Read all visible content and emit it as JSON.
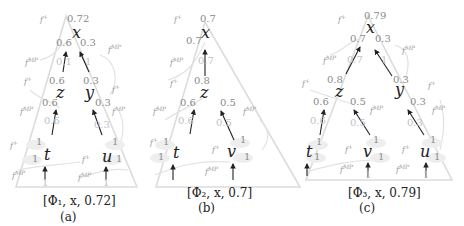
{
  "figures": [
    {
      "id": "a",
      "caption_formula": "[Φ₁, x, 0.72]",
      "sub_label": "(a)",
      "root": {
        "var": "x",
        "value": "0.72",
        "fn": "f⁺"
      },
      "root_inputs": {
        "left": "0.6",
        "right": "0.3",
        "fn": "f^MP"
      },
      "edges_mid": {
        "left": "0.1",
        "right": "1"
      },
      "level2": [
        {
          "var": "z",
          "value": "0.6",
          "fn": "f⁺",
          "input": "0.6",
          "input_fn": "f^MP",
          "edge": "0.6"
        },
        {
          "var": "y",
          "value": "0.3",
          "fn": "f⁺",
          "input": "0.3",
          "input_fn": "f^MP",
          "edge": "0.3"
        }
      ],
      "leaves": [
        {
          "var": "t",
          "value": "1",
          "fn": "f⁺",
          "input": "1",
          "input_fn": "f^MP",
          "edge": "1"
        },
        {
          "var": "u",
          "value": "1",
          "fn": "f⁺",
          "input": "1",
          "input_fn": "f^MP",
          "edge": "1"
        }
      ]
    },
    {
      "id": "b",
      "caption_formula": "[Φ₂, x, 0.7]",
      "sub_label": "(b)",
      "root": {
        "var": "x",
        "value": "0.7",
        "fn": "f⁺"
      },
      "root_inputs": {
        "left": "0.7",
        "fn": "f^MP"
      },
      "edges_mid": {
        "left": "0.7"
      },
      "level2": [
        {
          "var": "z",
          "value": "0.8",
          "fn": "f⁺",
          "inputs": [
            "0.6",
            "0.5"
          ],
          "input_fns": [
            "f^MP",
            "f^MP"
          ],
          "edges": [
            "0.6",
            "0.5"
          ]
        }
      ],
      "leaves": [
        {
          "var": "t",
          "value": "1",
          "fn": "f⁺",
          "input": "1",
          "input_fn": "f^MP",
          "edge": "1"
        },
        {
          "var": "v",
          "value": "1",
          "fn": "f⁺",
          "input": "1",
          "input_fn": "f^MP",
          "edge": "1"
        }
      ]
    },
    {
      "id": "c",
      "caption_formula": "[Φ₃, x, 0.79]",
      "sub_label": "(c)",
      "root": {
        "var": "x",
        "value": "0.79",
        "fn": "f⁺"
      },
      "root_inputs": {
        "left": "0.7",
        "right": "0.3",
        "fn": "f^MP"
      },
      "edges_mid": {
        "left": "0.7",
        "right": "1"
      },
      "level2": [
        {
          "var": "z",
          "value": "0.8",
          "fn": "f⁺",
          "inputs": [
            "0.6",
            "0.5"
          ],
          "input_fn": "f^MP",
          "edges": [
            "0.6",
            "0.5"
          ]
        },
        {
          "var": "y",
          "value": "0.3",
          "fn": "f⁺",
          "input": "0.3",
          "input_fn": "f^MP",
          "edge": "0.3"
        }
      ],
      "leaves": [
        {
          "var": "t",
          "value": "1",
          "fn": "f⁺",
          "input": "1",
          "input_fn": "f^MP",
          "edge": "1"
        },
        {
          "var": "v",
          "value": "1",
          "fn": "f⁺",
          "input": "1",
          "input_fn": "f^MP",
          "edge": "1"
        },
        {
          "var": "u",
          "value": "1",
          "fn": "f⁺",
          "input": "1",
          "input_fn": "f^MP",
          "edge": "1"
        }
      ]
    }
  ],
  "labels": {
    "fplus": "f⁺",
    "fmp_base": "f",
    "fmp_sup": "MP",
    "f_base": "f",
    "plus_sup": "+"
  }
}
